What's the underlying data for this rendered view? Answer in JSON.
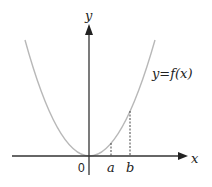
{
  "diagram": {
    "type": "function-graph",
    "axes": {
      "x_label": "x",
      "y_label": "y",
      "origin_label": "0"
    },
    "curve": {
      "label": "y=f(x)",
      "shape": "parabola",
      "vertex": [
        0,
        0
      ],
      "color": "#b8b8b8"
    },
    "markers": [
      {
        "label": "a",
        "style": "dashed"
      },
      {
        "label": "b",
        "style": "dashed"
      }
    ],
    "colors": {
      "axis": "#333333",
      "curve": "#b8b8b8",
      "dashes": "#444444"
    }
  }
}
